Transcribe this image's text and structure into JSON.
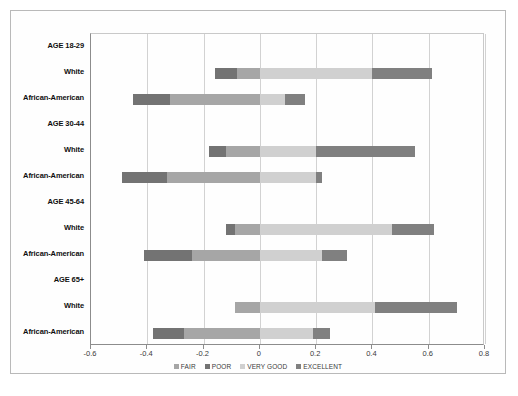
{
  "chart_data": {
    "type": "bar",
    "subtype": "diverging-stacked-bar",
    "title": "",
    "xlabel": "",
    "ylabel": "",
    "xlim": [
      -0.6,
      0.8
    ],
    "xticks": [
      -0.6,
      -0.4,
      -0.2,
      0,
      0.2,
      0.4,
      0.6,
      0.8
    ],
    "xtick_labels": [
      "-0.6",
      "-0.4",
      "-0.2",
      "0",
      "0.2",
      "0.4",
      "0.6",
      "0.8"
    ],
    "grid": true,
    "grid_axis": "x",
    "legend_position": "bottom",
    "legend": [
      "FAIR",
      "POOR",
      "VERY GOOD",
      "EXCELLENT"
    ],
    "series": [
      {
        "name": "FAIR",
        "color": "#a6a6a6"
      },
      {
        "name": "POOR",
        "color": "#737373"
      },
      {
        "name": "VERY GOOD",
        "color": "#d0d0d0"
      },
      {
        "name": "EXCELLENT",
        "color": "#808080"
      }
    ],
    "categories": [
      {
        "label": "AGE 18-29",
        "is_group_header": true,
        "segments": []
      },
      {
        "label": "White",
        "is_group_header": false,
        "segments": [
          {
            "series": "POOR",
            "start": -0.16,
            "end": -0.08,
            "color": "#737373"
          },
          {
            "series": "FAIR",
            "start": -0.08,
            "end": 0.0,
            "color": "#a6a6a6"
          },
          {
            "series": "VERY GOOD",
            "start": 0.0,
            "end": 0.4,
            "color": "#d0d0d0"
          },
          {
            "series": "EXCELLENT",
            "start": 0.4,
            "end": 0.61,
            "color": "#808080"
          }
        ]
      },
      {
        "label": "African-American",
        "is_group_header": false,
        "segments": [
          {
            "series": "POOR",
            "start": -0.45,
            "end": -0.32,
            "color": "#737373"
          },
          {
            "series": "FAIR",
            "start": -0.32,
            "end": 0.0,
            "color": "#a6a6a6"
          },
          {
            "series": "VERY GOOD",
            "start": 0.0,
            "end": 0.09,
            "color": "#d0d0d0"
          },
          {
            "series": "EXCELLENT",
            "start": 0.09,
            "end": 0.16,
            "color": "#808080"
          }
        ]
      },
      {
        "label": "AGE 30-44",
        "is_group_header": true,
        "segments": []
      },
      {
        "label": "White",
        "is_group_header": false,
        "segments": [
          {
            "series": "POOR",
            "start": -0.18,
            "end": -0.12,
            "color": "#737373"
          },
          {
            "series": "FAIR",
            "start": -0.12,
            "end": 0.0,
            "color": "#a6a6a6"
          },
          {
            "series": "VERY GOOD",
            "start": 0.0,
            "end": 0.2,
            "color": "#d0d0d0"
          },
          {
            "series": "EXCELLENT",
            "start": 0.2,
            "end": 0.55,
            "color": "#808080"
          }
        ]
      },
      {
        "label": "African-American",
        "is_group_header": false,
        "segments": [
          {
            "series": "POOR",
            "start": -0.49,
            "end": -0.33,
            "color": "#737373"
          },
          {
            "series": "FAIR",
            "start": -0.33,
            "end": 0.0,
            "color": "#a6a6a6"
          },
          {
            "series": "VERY GOOD",
            "start": 0.0,
            "end": 0.2,
            "color": "#d0d0d0"
          },
          {
            "series": "EXCELLENT",
            "start": 0.2,
            "end": 0.22,
            "color": "#808080"
          }
        ]
      },
      {
        "label": "AGE 45-64",
        "is_group_header": true,
        "segments": []
      },
      {
        "label": "White",
        "is_group_header": false,
        "segments": [
          {
            "series": "POOR",
            "start": -0.12,
            "end": -0.09,
            "color": "#737373"
          },
          {
            "series": "FAIR",
            "start": -0.09,
            "end": 0.0,
            "color": "#a6a6a6"
          },
          {
            "series": "VERY GOOD",
            "start": 0.0,
            "end": 0.47,
            "color": "#d0d0d0"
          },
          {
            "series": "EXCELLENT",
            "start": 0.47,
            "end": 0.62,
            "color": "#808080"
          }
        ]
      },
      {
        "label": "African-American",
        "is_group_header": false,
        "segments": [
          {
            "series": "POOR",
            "start": -0.41,
            "end": -0.24,
            "color": "#737373"
          },
          {
            "series": "FAIR",
            "start": -0.24,
            "end": 0.0,
            "color": "#a6a6a6"
          },
          {
            "series": "VERY GOOD",
            "start": 0.0,
            "end": 0.22,
            "color": "#d0d0d0"
          },
          {
            "series": "EXCELLENT",
            "start": 0.22,
            "end": 0.31,
            "color": "#808080"
          }
        ]
      },
      {
        "label": "AGE 65+",
        "is_group_header": true,
        "segments": []
      },
      {
        "label": "White",
        "is_group_header": false,
        "segments": [
          {
            "series": "FAIR",
            "start": -0.09,
            "end": 0.0,
            "color": "#a6a6a6"
          },
          {
            "series": "VERY GOOD",
            "start": 0.0,
            "end": 0.41,
            "color": "#d0d0d0"
          },
          {
            "series": "EXCELLENT",
            "start": 0.41,
            "end": 0.7,
            "color": "#808080"
          }
        ]
      },
      {
        "label": "African-American",
        "is_group_header": false,
        "segments": [
          {
            "series": "POOR",
            "start": -0.38,
            "end": -0.27,
            "color": "#737373"
          },
          {
            "series": "FAIR",
            "start": -0.27,
            "end": 0.0,
            "color": "#a6a6a6"
          },
          {
            "series": "VERY GOOD",
            "start": 0.0,
            "end": 0.19,
            "color": "#d0d0d0"
          },
          {
            "series": "EXCELLENT",
            "start": 0.19,
            "end": 0.25,
            "color": "#808080"
          }
        ]
      }
    ]
  }
}
